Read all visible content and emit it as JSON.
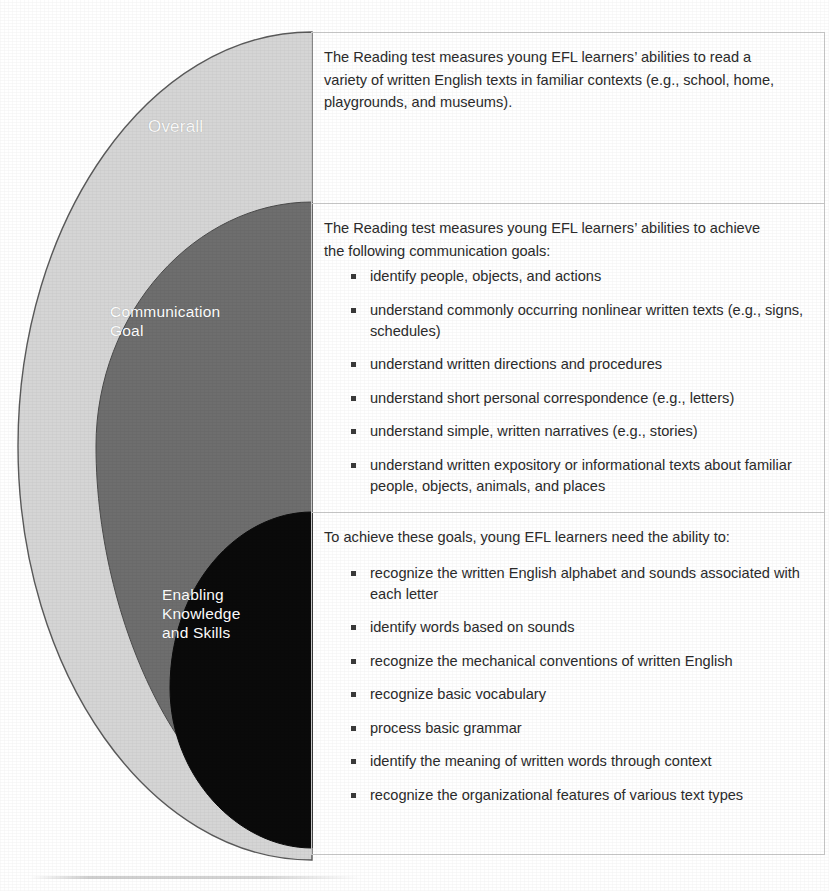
{
  "diagram": {
    "layers": [
      {
        "id": "overall",
        "label": "Overall",
        "color": "#d5d5d5",
        "text_color": "#ffffff"
      },
      {
        "id": "communication-goal",
        "label": "Communication\nGoal",
        "color": "#6e6e6e",
        "text_color": "#ffffff"
      },
      {
        "id": "enabling-knowledge-and-skills",
        "label": "Enabling\nKnowledge\nand Skills",
        "color": "#0a0a0a",
        "text_color": "#ffffff"
      }
    ]
  },
  "panels": [
    {
      "id": "overall",
      "intro": "The Reading test measures young EFL learners’ abilities to read a variety of written English texts in familiar contexts (e.g., school, home, playgrounds, and museums).",
      "bullets": []
    },
    {
      "id": "communication-goal",
      "intro": "The Reading test measures young EFL learners’ abilities to achieve the following communication goals:",
      "bullets": [
        "identify people, objects, and actions",
        "understand commonly occurring nonlinear written texts (e.g., signs, schedules)",
        "understand written directions and procedures",
        "understand short personal correspondence (e.g., letters)",
        "understand simple, written narratives (e.g., stories)",
        "understand written expository or informational texts about familiar people, objects, animals, and places"
      ]
    },
    {
      "id": "enabling-knowledge-and-skills",
      "intro": "To achieve these goals, young EFL learners need the ability to:",
      "bullets": [
        "recognize the written English alphabet and sounds associated with each letter",
        "identify words based on sounds",
        "recognize the mechanical conventions of written English",
        "recognize basic vocabulary",
        "process basic grammar",
        "identify the meaning of written words through context",
        "recognize the organizational features of various text types"
      ]
    }
  ]
}
